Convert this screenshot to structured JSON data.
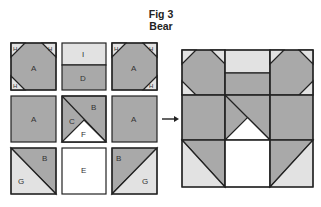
{
  "figure": {
    "title_line1": "Fig 3",
    "title_line2": "Bear"
  },
  "colors": {
    "dark": "#a9a9a9",
    "light": "#e2e2e2",
    "white": "#ffffff",
    "stroke": "#222222"
  },
  "units": {
    "row1": [
      {
        "id": "corner-tl",
        "labels": {
          "center": "A",
          "corners": [
            "H",
            "H",
            "H"
          ]
        }
      },
      {
        "id": "top-middle",
        "labels": {
          "top": "I",
          "bottom": "D"
        }
      },
      {
        "id": "corner-tr",
        "labels": {
          "center": "A",
          "corners": [
            "H",
            "H",
            "H"
          ]
        }
      }
    ],
    "row2": [
      {
        "id": "middle-left",
        "labels": {
          "center": "A"
        }
      },
      {
        "id": "center",
        "labels": {
          "upper_right": "B",
          "left": "C",
          "bottom": "F"
        }
      },
      {
        "id": "middle-right",
        "labels": {
          "center": "A"
        }
      }
    ],
    "row3": [
      {
        "id": "bottom-left",
        "labels": {
          "upper": "B",
          "lower": "G"
        }
      },
      {
        "id": "bottom-middle",
        "labels": {
          "center": "E"
        }
      },
      {
        "id": "bottom-right",
        "labels": {
          "upper": "B",
          "lower": "G"
        }
      }
    ]
  },
  "text": {
    "H": "H",
    "A": "A",
    "I": "I",
    "D": "D",
    "B": "B",
    "C": "C",
    "F": "F",
    "E": "E",
    "G": "G"
  },
  "arrow": "→"
}
